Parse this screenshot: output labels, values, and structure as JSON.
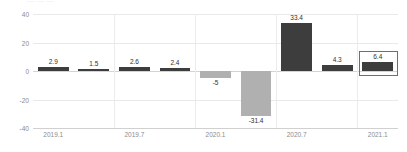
{
  "top_artifact_text": "— — —",
  "chart_data": {
    "type": "bar",
    "title": "",
    "subtitle": "",
    "xlabel": "",
    "ylabel": "",
    "ylim": [
      -40,
      40
    ],
    "yticks": [
      40,
      20,
      0,
      -20,
      -40
    ],
    "ytick_labels": [
      "40",
      "20",
      "0",
      "-20",
      "-40"
    ],
    "grid": true,
    "legend": false,
    "legend_position": "none",
    "x_tick_labels": [
      "2019.1",
      "2019.7",
      "2020.1",
      "2020.7",
      "2021.1"
    ],
    "x_tick_positions": [
      0,
      2,
      4,
      6,
      8
    ],
    "categories": [
      "2019.1",
      "2019.2",
      "2019.7",
      "2019.8",
      "2020.1",
      "2020.2",
      "2020.7",
      "2020.8",
      "2021.1"
    ],
    "values": [
      2.9,
      1.5,
      2.6,
      2.4,
      -5,
      -31.4,
      33.4,
      4.3,
      6.4
    ],
    "data_labels": [
      "2.9",
      "1.5",
      "2.6",
      "2.4",
      "-5",
      "-31.4",
      "33.4",
      "4.3",
      "6.4"
    ],
    "bar_colors": [
      "#3d3d3d",
      "#3d3d3d",
      "#3d3d3d",
      "#3d3d3d",
      "#b0b0b0",
      "#b0b0b0",
      "#3d3d3d",
      "#3d3d3d",
      "#3d3d3d"
    ],
    "highlighted_index": 8,
    "highlight_border_color": "#6e6e6e",
    "colors": {
      "positive": "#3d3d3d",
      "negative": "#b0b0b0",
      "gridline": "#e9e9e9",
      "zero_line": "#d4d4d4",
      "axis": "#d0d0d0",
      "tick_label": "#8c8c8c",
      "data_label": "#2f2f2f",
      "background": "#ffffff"
    }
  }
}
